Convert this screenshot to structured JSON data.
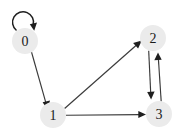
{
  "figure": {
    "kind": "directed-graph",
    "background_color": "#ffffff",
    "node_fill_color": "#ebebeb",
    "node_label_color": "#1a1a1a",
    "edge_color": "#3a3a3a",
    "arrow_color": "#1f1f1f",
    "width": 183,
    "height": 136
  },
  "nodes": [
    {
      "id": "0",
      "label": "0",
      "cx": 25,
      "cy": 41,
      "r": 13
    },
    {
      "id": "1",
      "label": "1",
      "cx": 53,
      "cy": 115,
      "r": 13
    },
    {
      "id": "2",
      "label": "2",
      "cx": 153,
      "cy": 38,
      "r": 13
    },
    {
      "id": "3",
      "label": "3",
      "cx": 159,
      "cy": 114,
      "r": 13
    }
  ],
  "edges": [
    {
      "id": "e-0-0",
      "from": "0",
      "to": "0",
      "type": "self-loop",
      "directed": true
    },
    {
      "id": "e-0-1",
      "from": "0",
      "to": "1",
      "type": "straight",
      "directed": true
    },
    {
      "id": "e-1-2",
      "from": "1",
      "to": "2",
      "type": "straight",
      "directed": true
    },
    {
      "id": "e-1-3",
      "from": "1",
      "to": "3",
      "type": "straight",
      "directed": true
    },
    {
      "id": "e-2-3",
      "from": "2",
      "to": "3",
      "type": "straight",
      "directed": true
    },
    {
      "id": "e-3-2",
      "from": "3",
      "to": "2",
      "type": "straight",
      "directed": true
    }
  ]
}
